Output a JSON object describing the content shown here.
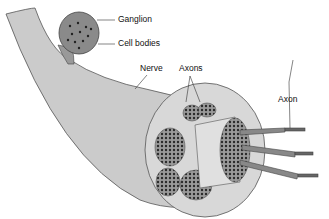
{
  "diagram": {
    "labels": {
      "ganglion": "Ganglion",
      "cell_bodies": "Cell bodies",
      "nerve": "Nerve",
      "axons": "Axons",
      "axon": "Axon"
    },
    "colors": {
      "nerve_fill": "#c8c8c8",
      "outline": "#444444",
      "fascicle_fill": "#6a6a6a",
      "dot": "#2a2a2a"
    }
  }
}
